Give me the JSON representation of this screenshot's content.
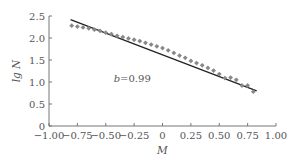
{
  "chart_data": {
    "type": "scatter",
    "title": "",
    "xlabel": "M",
    "ylabel": "lg N",
    "xlim": [
      -1.0,
      1.0
    ],
    "ylim": [
      0,
      2.5
    ],
    "grid": false,
    "xticks": [
      -1.0,
      -0.75,
      -0.5,
      -0.25,
      0,
      0.25,
      0.5,
      0.75,
      1.0
    ],
    "xtick_labels": [
      "−1.00",
      "−0.75",
      "−0.50",
      "−0.25",
      "0",
      "0.25",
      "0.50",
      "0.75",
      "1.00"
    ],
    "yticks": [
      0,
      0.5,
      1.0,
      1.5,
      2.0,
      2.5
    ],
    "ytick_labels": [
      "0",
      "0.5",
      "1.0",
      "1.5",
      "2.0",
      "2.5"
    ],
    "annotations": [
      {
        "text": "b=0.99",
        "x": -0.43,
        "y": 1.0
      }
    ],
    "series": [
      {
        "name": "observed",
        "kind": "scatter",
        "color": "#888888",
        "x": [
          -0.8,
          -0.75,
          -0.7,
          -0.65,
          -0.6,
          -0.55,
          -0.5,
          -0.45,
          -0.4,
          -0.35,
          -0.3,
          -0.25,
          -0.2,
          -0.15,
          -0.1,
          -0.05,
          0.0,
          0.05,
          0.1,
          0.15,
          0.2,
          0.25,
          0.3,
          0.35,
          0.4,
          0.45,
          0.5,
          0.55,
          0.6,
          0.65,
          0.7,
          0.75,
          0.8
        ],
        "y": [
          2.28,
          2.26,
          2.24,
          2.22,
          2.19,
          2.16,
          2.12,
          2.09,
          2.05,
          2.02,
          1.99,
          1.96,
          1.93,
          1.89,
          1.85,
          1.81,
          1.77,
          1.72,
          1.66,
          1.6,
          1.55,
          1.48,
          1.43,
          1.38,
          1.32,
          1.26,
          1.18,
          1.09,
          1.1,
          1.05,
          0.92,
          0.92,
          0.78
        ]
      },
      {
        "name": "fit",
        "kind": "line",
        "color": "#222222",
        "x": [
          -0.81,
          0.83
        ],
        "y": [
          2.42,
          0.8
        ]
      }
    ]
  }
}
